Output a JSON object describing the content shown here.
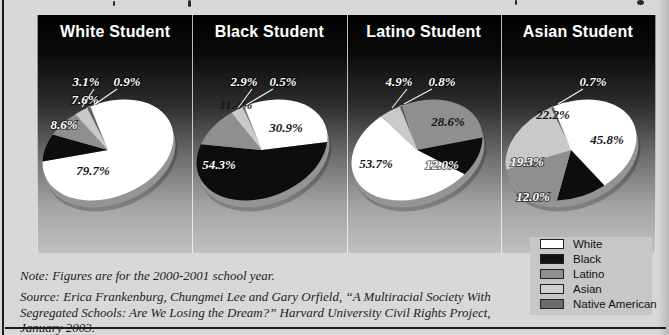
{
  "chart_data": {
    "type": "pie",
    "layout": {
      "direction": "clockwise",
      "start": "top",
      "tilt_deg": -22,
      "style": "3d-ellipse",
      "legend_position": "bottom-right"
    },
    "note": "Note: Figures are for the 2000-2001 school year.",
    "source": "Source: Erica Frankenburg, Chungmei Lee and Gary Orfield, “A Multiracial Society With Segregated Schools: Are We Losing the Dream?” Harvard University Civil Rights Project, January 2003.",
    "legend": [
      {
        "label": "White",
        "color": "#ffffff"
      },
      {
        "label": "Black",
        "color": "#111111"
      },
      {
        "label": "Latino",
        "color": "#8f8f8f"
      },
      {
        "label": "Asian",
        "color": "#d2d2d2"
      },
      {
        "label": "Native American",
        "color": "#6b6b6b"
      }
    ],
    "charts": [
      {
        "title": "White Student",
        "slices": [
          {
            "group": "White",
            "value": 79.7,
            "display": "79.7%",
            "color": "#ffffff",
            "text": "#161616",
            "outside": false
          },
          {
            "group": "Black",
            "value": 8.6,
            "display": "8.6%",
            "color": "#0d0d0d",
            "text": "#ffffff",
            "outside": false
          },
          {
            "group": "Latino",
            "value": 7.6,
            "display": "7.6%",
            "color": "#8f8f8f",
            "text": "#ffffff",
            "outside": false
          },
          {
            "group": "Asian",
            "value": 3.1,
            "display": "3.1%",
            "color": "#c9c9c9",
            "text": "#ffffff",
            "outside": true
          },
          {
            "group": "Native American",
            "value": 0.9,
            "display": "0.9%",
            "color": "#5c5c5c",
            "text": "#ffffff",
            "outside": true
          }
        ]
      },
      {
        "title": "Black Student",
        "slices": [
          {
            "group": "White",
            "value": 30.9,
            "display": "30.9%",
            "color": "#ffffff",
            "text": "#161616",
            "outside": false
          },
          {
            "group": "Black",
            "value": 54.3,
            "display": "54.3%",
            "color": "#0d0d0d",
            "text": "#ffffff",
            "outside": false
          },
          {
            "group": "Latino",
            "value": 11.4,
            "display": "11.4%",
            "color": "#8f8f8f",
            "text": "#161616",
            "outside": false
          },
          {
            "group": "Asian",
            "value": 2.9,
            "display": "2.9%",
            "color": "#c9c9c9",
            "text": "#ffffff",
            "outside": true
          },
          {
            "group": "Native American",
            "value": 0.5,
            "display": "0.5%",
            "color": "#5c5c5c",
            "text": "#ffffff",
            "outside": true
          }
        ]
      },
      {
        "title": "Latino Student",
        "slices": [
          {
            "group": "Native American",
            "value": 0.8,
            "display": "0.8%",
            "color": "#5c5c5c",
            "text": "#ffffff",
            "outside": true
          },
          {
            "group": "Latino",
            "value": 28.6,
            "display": "28.6%",
            "color": "#8f8f8f",
            "text": "#161616",
            "outside": false
          },
          {
            "group": "Black",
            "value": 12.0,
            "display": "12.0%",
            "color": "#0d0d0d",
            "text": "#ffffff",
            "outside": false
          },
          {
            "group": "White",
            "value": 53.7,
            "display": "53.7%",
            "color": "#ffffff",
            "text": "#161616",
            "outside": false
          },
          {
            "group": "Asian",
            "value": 4.9,
            "display": "4.9%",
            "color": "#c9c9c9",
            "text": "#ffffff",
            "outside": true
          }
        ]
      },
      {
        "title": "Asian Student",
        "slices": [
          {
            "group": "White",
            "value": 45.8,
            "display": "45.8%",
            "color": "#ffffff",
            "text": "#161616",
            "outside": false
          },
          {
            "group": "Black",
            "value": 12.0,
            "display": "12.0%",
            "color": "#0d0d0d",
            "text": "#ffffff",
            "outside": false
          },
          {
            "group": "Latino",
            "value": 19.3,
            "display": "19.3%",
            "color": "#8f8f8f",
            "text": "#ffffff",
            "outside": false
          },
          {
            "group": "Asian",
            "value": 22.2,
            "display": "22.2%",
            "color": "#c9c9c9",
            "text": "#161616",
            "outside": false
          },
          {
            "group": "Native American",
            "value": 0.7,
            "display": "0.7%",
            "color": "#5c5c5c",
            "text": "#ffffff",
            "outside": true
          }
        ]
      }
    ]
  }
}
